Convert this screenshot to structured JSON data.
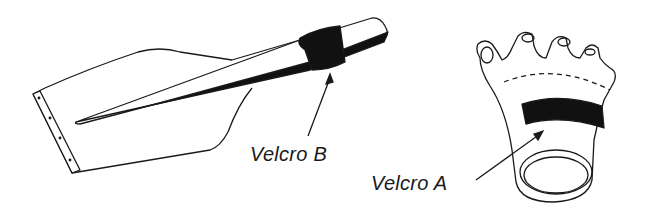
{
  "figure": {
    "parts": [
      {
        "id": "paddle",
        "description": "paddle-shaped hand piece with tapered shaft"
      },
      {
        "id": "glove",
        "description": "fingerless glove with wrist ring"
      }
    ],
    "labels": {
      "velcro_b": "Velcro B",
      "velcro_a": "Velcro A"
    },
    "colors": {
      "line": "#1a1a1a",
      "fill_dark": "#111111",
      "background": "#ffffff"
    }
  }
}
